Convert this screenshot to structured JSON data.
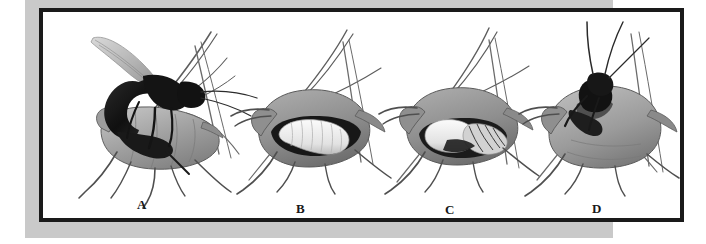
{
  "figure": {
    "kind": "illustration-plate",
    "medium": "grayscale scientific illustration",
    "background_color": "#ffffff",
    "backdrop_color": "#c9c9c9",
    "frame_color": "#1a1a1a",
    "plate_background": "#ffffff",
    "panel_count": 4
  },
  "palette": {
    "aphid_body_light": "#b8b8b8",
    "aphid_body_mid": "#9a9a9a",
    "aphid_body_dark": "#6e6e6e",
    "aphid_shadow": "#4a4a4a",
    "wasp_black": "#171717",
    "larva_white": "#f2f2f2",
    "larva_shade": "#cfcfcf",
    "leg_gray": "#585858",
    "wing_gray": "#b0b0b0",
    "outline": "#3a3a3a"
  },
  "panels": [
    {
      "id": "a",
      "label": "A",
      "caption_text": "A",
      "scene": "adult black parasitoid wasp curling its abdomen to oviposit into a living aphid",
      "elements": [
        "adult-wasp",
        "wasp-wing",
        "aphid-host",
        "aphid-antennae",
        "aphid-legs",
        "cornicles"
      ]
    },
    {
      "id": "b",
      "label": "B",
      "caption_text": "B",
      "scene": "swollen aphid with a white wasp larva feeding inside the body cavity",
      "elements": [
        "aphid-mummy",
        "wasp-larva",
        "aphid-antennae",
        "aphid-legs",
        "cornicles"
      ]
    },
    {
      "id": "c",
      "label": "C",
      "caption_text": "C",
      "scene": "aphid mummy containing the developing wasp pupa",
      "elements": [
        "aphid-mummy",
        "wasp-pupa",
        "aphid-antennae",
        "aphid-legs",
        "cornicles"
      ]
    },
    {
      "id": "d",
      "label": "D",
      "caption_text": "D",
      "scene": "adult wasp emerging from the exit hole in the hardened aphid mummy",
      "elements": [
        "aphid-mummy",
        "emerging-wasp",
        "wasp-antennae",
        "aphid-legs",
        "cornicles"
      ]
    }
  ]
}
